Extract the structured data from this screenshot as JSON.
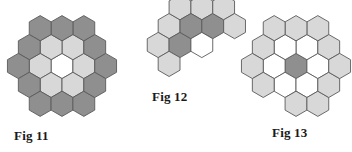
{
  "page": {
    "background_color": "#ffffff",
    "width": 352,
    "height": 152
  },
  "palette": {
    "dark_gray": "#8f8f8f",
    "light_gray": "#d8d8d8",
    "white": "#ffffff",
    "stroke": "#5a5a5a",
    "label_text": "#1a1a1a"
  },
  "figures": [
    {
      "id": "fig-11",
      "label": "Fig 11",
      "label_x": 14,
      "label_y": 140,
      "origin_x": 62,
      "origin_y": 66,
      "hex_radius": 12.6,
      "description": "Hexagonal ring: dark outer ring, light inner ring, white center",
      "cells": [
        {
          "name": "center",
          "q": 0,
          "r": 0,
          "fill": "white"
        },
        {
          "name": "inner-e",
          "q": 1,
          "r": 0,
          "fill": "light_gray"
        },
        {
          "name": "inner-ne",
          "q": 1,
          "r": -1,
          "fill": "light_gray"
        },
        {
          "name": "inner-nw",
          "q": 0,
          "r": -1,
          "fill": "light_gray"
        },
        {
          "name": "inner-w",
          "q": -1,
          "r": 0,
          "fill": "light_gray"
        },
        {
          "name": "inner-sw",
          "q": -1,
          "r": 1,
          "fill": "light_gray"
        },
        {
          "name": "inner-se",
          "q": 0,
          "r": 1,
          "fill": "light_gray"
        },
        {
          "name": "outer-1",
          "q": 2,
          "r": 0,
          "fill": "dark_gray"
        },
        {
          "name": "outer-2",
          "q": 2,
          "r": -1,
          "fill": "dark_gray"
        },
        {
          "name": "outer-3",
          "q": 2,
          "r": -2,
          "fill": "dark_gray"
        },
        {
          "name": "outer-4",
          "q": 1,
          "r": -2,
          "fill": "dark_gray"
        },
        {
          "name": "outer-5",
          "q": 0,
          "r": -2,
          "fill": "dark_gray"
        },
        {
          "name": "outer-6",
          "q": -1,
          "r": -1,
          "fill": "dark_gray"
        },
        {
          "name": "outer-7",
          "q": -2,
          "r": 0,
          "fill": "dark_gray"
        },
        {
          "name": "outer-8",
          "q": -2,
          "r": 1,
          "fill": "dark_gray"
        },
        {
          "name": "outer-9",
          "q": -2,
          "r": 2,
          "fill": "dark_gray"
        },
        {
          "name": "outer-10",
          "q": -1,
          "r": 2,
          "fill": "dark_gray"
        },
        {
          "name": "outer-11",
          "q": 0,
          "r": 2,
          "fill": "dark_gray"
        },
        {
          "name": "outer-12",
          "q": 1,
          "r": 1,
          "fill": "dark_gray"
        }
      ]
    },
    {
      "id": "fig-12",
      "label": "Fig 12",
      "label_x": 152,
      "label_y": 101,
      "origin_x": 180,
      "origin_y": 45,
      "hex_radius": 12.6,
      "description": "Three rows: top 3 light, middle 5 with 3 dark, bottom 3 with white center",
      "cells": [
        {
          "name": "top-1",
          "q": 0,
          "r": -1,
          "fill": "light_gray"
        },
        {
          "name": "top-2",
          "q": 1,
          "r": -2,
          "fill": "light_gray"
        },
        {
          "name": "top-3",
          "q": 2,
          "r": -2,
          "fill": "light_gray"
        },
        {
          "name": "mid-left-outer",
          "q": -1,
          "r": 0,
          "fill": "light_gray"
        },
        {
          "name": "mid-left-dark",
          "q": 0,
          "r": 0,
          "fill": "dark_gray"
        },
        {
          "name": "mid-center-dark",
          "q": 1,
          "r": -1,
          "fill": "dark_gray"
        },
        {
          "name": "mid-right-dark",
          "q": 2,
          "r": -1,
          "fill": "dark_gray"
        },
        {
          "name": "mid-right-outer",
          "q": 3,
          "r": -2,
          "fill": "light_gray"
        },
        {
          "name": "bot-left",
          "q": -1,
          "r": 1,
          "fill": "light_gray"
        },
        {
          "name": "bot-center",
          "q": 1,
          "r": 0,
          "fill": "white"
        },
        {
          "name": "bot-right",
          "q": 3,
          "r": -1,
          "fill": "light_gray"
        }
      ]
    },
    {
      "id": "fig-13",
      "label": "Fig 13",
      "label_x": 272,
      "label_y": 137,
      "origin_x": 296,
      "origin_y": 66,
      "hex_radius": 12.6,
      "description": "Hexagonal ring of light and white cells with single dark gray center",
      "cells": [
        {
          "name": "center-dark",
          "q": 0,
          "r": 0,
          "fill": "dark_gray"
        },
        {
          "name": "inner-e",
          "q": 1,
          "r": 0,
          "fill": "white"
        },
        {
          "name": "inner-ne",
          "q": 1,
          "r": -1,
          "fill": "white"
        },
        {
          "name": "inner-nw",
          "q": 0,
          "r": -1,
          "fill": "white"
        },
        {
          "name": "inner-w",
          "q": -1,
          "r": 0,
          "fill": "white"
        },
        {
          "name": "inner-sw",
          "q": -1,
          "r": 1,
          "fill": "white"
        },
        {
          "name": "inner-se",
          "q": 0,
          "r": 1,
          "fill": "white"
        },
        {
          "name": "outer-1",
          "q": 2,
          "r": -1,
          "fill": "light_gray"
        },
        {
          "name": "outer-2",
          "q": 2,
          "r": -2,
          "fill": "light_gray"
        },
        {
          "name": "outer-3",
          "q": 1,
          "r": -2,
          "fill": "light_gray"
        },
        {
          "name": "outer-4",
          "q": 0,
          "r": -2,
          "fill": "light_gray"
        },
        {
          "name": "outer-5",
          "q": -1,
          "r": -1,
          "fill": "light_gray"
        },
        {
          "name": "outer-6",
          "q": -2,
          "r": 0,
          "fill": "light_gray"
        },
        {
          "name": "outer-7",
          "q": -2,
          "r": 1,
          "fill": "light_gray"
        },
        {
          "name": "outer-8",
          "q": -1,
          "r": 2,
          "fill": "light_gray"
        },
        {
          "name": "outer-9",
          "q": 0,
          "r": 2,
          "fill": "light_gray"
        },
        {
          "name": "outer-10",
          "q": 1,
          "r": 1,
          "fill": "light_gray"
        },
        {
          "name": "outer-11",
          "q": 2,
          "r": 0,
          "fill": "light_gray"
        }
      ]
    }
  ]
}
